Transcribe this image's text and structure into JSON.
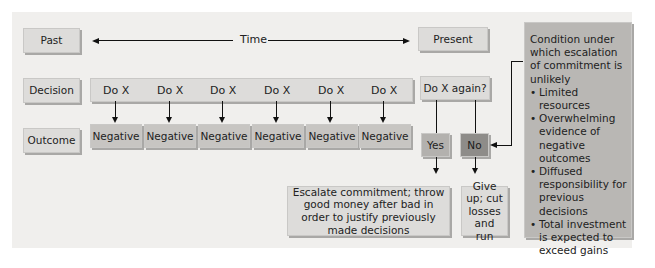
{
  "rows": {
    "past": "Past",
    "decision": "Decision",
    "outcome": "Outcome",
    "present": "Present"
  },
  "time_label": "Time",
  "decisions": [
    "Do X",
    "Do X",
    "Do X",
    "Do X",
    "Do X",
    "Do X"
  ],
  "outcomes": [
    "Negative",
    "Negative",
    "Negative",
    "Negative",
    "Negative",
    "Negative"
  ],
  "question": "Do X again?",
  "yes": "Yes",
  "no": "No",
  "escalate": "Escalate commitment; throw good money after bad in order to justify previously made decisions",
  "give_up": "Give up; cut losses and run",
  "condition": {
    "title": "Condition under which escalation of commitment is unlikely",
    "items": [
      "Limited resources",
      "Overwhelming evidence of negative outcomes",
      "Diffused responsibility for previous decisions",
      "Total investment is expected to exceed gains"
    ]
  }
}
